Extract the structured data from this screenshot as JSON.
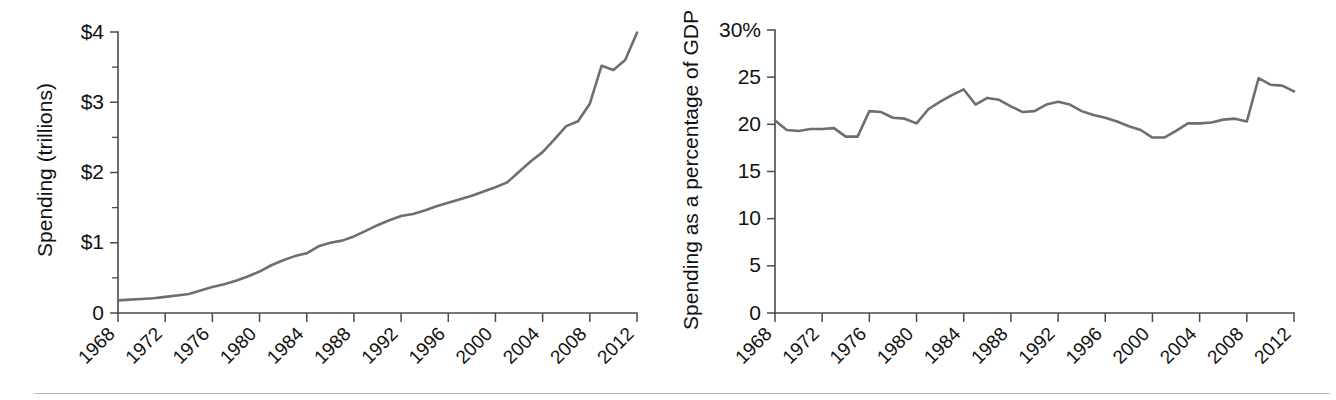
{
  "figure": {
    "background_color": "#ffffff",
    "line_color": "#6e6e6e",
    "axis_color": "#4a4a4a",
    "text_color": "#111111",
    "footer_rule_color": "#b9b9b9"
  },
  "panels": [
    {
      "id": "spending-trillions",
      "ylabel": "Spending (trillions)",
      "xlabel": "",
      "ytick_labels": [
        "0",
        "$1",
        "$2",
        "$3",
        "$4"
      ],
      "xtick_labels": [
        "1968",
        "1972",
        "1976",
        "1980",
        "1984",
        "1988",
        "1992",
        "1996",
        "2000",
        "2004",
        "2008",
        "2012"
      ]
    },
    {
      "id": "spending-percent-gdp",
      "ylabel": "Spending as a percentage of GDP",
      "xlabel": "",
      "ytick_labels": [
        "0",
        "5",
        "10",
        "15",
        "20",
        "25",
        "30%"
      ],
      "xtick_labels": [
        "1968",
        "1972",
        "1976",
        "1980",
        "1984",
        "1988",
        "1992",
        "1996",
        "2000",
        "2004",
        "2008",
        "2012"
      ]
    }
  ],
  "chart_data": [
    {
      "type": "line",
      "title": "",
      "subtitle": "",
      "xlabel": "",
      "ylabel": "Spending (trillions)",
      "xlim": [
        1968,
        2012
      ],
      "ylim": [
        0,
        4
      ],
      "xticks": [
        1968,
        1972,
        1976,
        1980,
        1984,
        1988,
        1992,
        1996,
        2000,
        2004,
        2008,
        2012
      ],
      "xticklabels": [
        "1968",
        "1972",
        "1976",
        "1980",
        "1984",
        "1988",
        "1992",
        "1996",
        "2000",
        "2004",
        "2008",
        "2012"
      ],
      "yticks": [
        0,
        1,
        2,
        3,
        4
      ],
      "yticklabels": [
        "0",
        "$1",
        "$2",
        "$3",
        "$4"
      ],
      "yminor_ticks": [
        0.5,
        1.5,
        2.5,
        3.5
      ],
      "grid": false,
      "legend": false,
      "x": [
        1968,
        1969,
        1970,
        1971,
        1972,
        1973,
        1974,
        1975,
        1976,
        1977,
        1978,
        1979,
        1980,
        1981,
        1982,
        1983,
        1984,
        1985,
        1986,
        1987,
        1988,
        1989,
        1990,
        1991,
        1992,
        1993,
        1994,
        1995,
        1996,
        1997,
        1998,
        1999,
        2000,
        2001,
        2002,
        2003,
        2004,
        2005,
        2006,
        2007,
        2008,
        2009,
        2010,
        2011,
        2012
      ],
      "series": [
        {
          "name": "Total government spending",
          "units": "trillions of dollars",
          "values": [
            0.18,
            0.19,
            0.2,
            0.21,
            0.23,
            0.25,
            0.27,
            0.32,
            0.37,
            0.41,
            0.46,
            0.52,
            0.59,
            0.68,
            0.75,
            0.81,
            0.85,
            0.95,
            1.0,
            1.03,
            1.09,
            1.17,
            1.25,
            1.32,
            1.38,
            1.41,
            1.46,
            1.52,
            1.57,
            1.62,
            1.67,
            1.73,
            1.79,
            1.86,
            2.01,
            2.16,
            2.29,
            2.47,
            2.66,
            2.73,
            2.98,
            3.52,
            3.46,
            3.6,
            3.99
          ]
        }
      ]
    },
    {
      "type": "line",
      "title": "",
      "subtitle": "",
      "xlabel": "",
      "ylabel": "Spending as a percentage of GDP",
      "xlim": [
        1968,
        2012
      ],
      "ylim": [
        0,
        30
      ],
      "xticks": [
        1968,
        1972,
        1976,
        1980,
        1984,
        1988,
        1992,
        1996,
        2000,
        2004,
        2008,
        2012
      ],
      "xticklabels": [
        "1968",
        "1972",
        "1976",
        "1980",
        "1984",
        "1988",
        "1992",
        "1996",
        "2000",
        "2004",
        "2008",
        "2012"
      ],
      "yticks": [
        0,
        5,
        10,
        15,
        20,
        25,
        30
      ],
      "yticklabels": [
        "0",
        "5",
        "10",
        "15",
        "20",
        "25",
        "30%"
      ],
      "yminor_ticks": [],
      "grid": false,
      "legend": false,
      "x": [
        1968,
        1969,
        1970,
        1971,
        1972,
        1973,
        1974,
        1975,
        1976,
        1977,
        1978,
        1979,
        1980,
        1981,
        1982,
        1983,
        1984,
        1985,
        1986,
        1987,
        1988,
        1989,
        1990,
        1991,
        1992,
        1993,
        1994,
        1995,
        1996,
        1997,
        1998,
        1999,
        2000,
        2001,
        2002,
        2003,
        2004,
        2005,
        2006,
        2007,
        2008,
        2009,
        2010,
        2011,
        2012
      ],
      "series": [
        {
          "name": "Total government spending as share of GDP",
          "units": "percent of GDP",
          "values": [
            20.4,
            19.4,
            19.3,
            19.5,
            19.5,
            19.6,
            18.7,
            18.7,
            21.4,
            21.3,
            20.7,
            20.6,
            20.1,
            21.6,
            22.4,
            23.1,
            23.7,
            22.1,
            22.8,
            22.6,
            21.9,
            21.3,
            21.4,
            22.1,
            22.4,
            22.1,
            21.4,
            21.0,
            20.7,
            20.3,
            19.8,
            19.4,
            18.6,
            18.6,
            19.3,
            20.1,
            20.1,
            20.2,
            20.5,
            20.6,
            20.3,
            24.9,
            24.2,
            24.1,
            23.5
          ]
        }
      ]
    }
  ]
}
